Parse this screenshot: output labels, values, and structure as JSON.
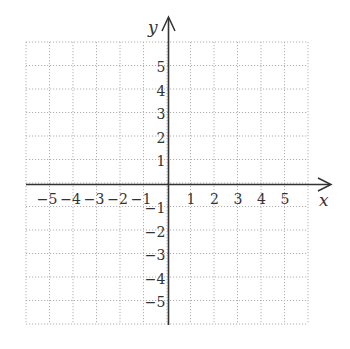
{
  "figure": {
    "type": "coordinate-plane",
    "x_axis_label": "x",
    "y_axis_label": "y",
    "x_range": [
      -6,
      6
    ],
    "y_range": [
      -6,
      6
    ],
    "grid": "dotted",
    "colors": {
      "axis": "#333333",
      "grid": "#b0b0b0",
      "text": "#333333"
    },
    "x_ticks": [
      {
        "value": -5,
        "label": "−5"
      },
      {
        "value": -4,
        "label": "−4"
      },
      {
        "value": -3,
        "label": "−3"
      },
      {
        "value": -2,
        "label": "−2"
      },
      {
        "value": -1,
        "label": "−1"
      },
      {
        "value": 1,
        "label": "1"
      },
      {
        "value": 2,
        "label": "2"
      },
      {
        "value": 3,
        "label": "3"
      },
      {
        "value": 4,
        "label": "4"
      },
      {
        "value": 5,
        "label": "5"
      }
    ],
    "y_ticks": [
      {
        "value": 5,
        "label": "5"
      },
      {
        "value": 4,
        "label": "4"
      },
      {
        "value": 3,
        "label": "3"
      },
      {
        "value": 2,
        "label": "2"
      },
      {
        "value": 1,
        "label": "1"
      },
      {
        "value": -1,
        "label": "−1"
      },
      {
        "value": -2,
        "label": "−2"
      },
      {
        "value": -3,
        "label": "−3"
      },
      {
        "value": -4,
        "label": "−4"
      },
      {
        "value": -5,
        "label": "−5"
      }
    ]
  }
}
